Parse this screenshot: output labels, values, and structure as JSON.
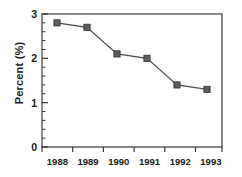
{
  "chart_data": {
    "type": "line",
    "title": "",
    "xlabel": "",
    "ylabel": "Percent (%)",
    "categories": [
      "1988",
      "1989",
      "1990",
      "1991",
      "1992",
      "1993"
    ],
    "values": [
      2.8,
      2.7,
      2.1,
      2.0,
      1.4,
      1.3
    ],
    "series": [
      {
        "name": "Percent",
        "values": [
          2.8,
          2.7,
          2.1,
          2.0,
          1.4,
          1.3
        ],
        "marker": "square",
        "marker_color": "#5c5c5c",
        "line_color": "#4a4a4a"
      }
    ],
    "ylim": [
      0,
      3
    ],
    "yticks": [
      0,
      1,
      2,
      3
    ],
    "ytick_labels": [
      "0",
      "1",
      "2",
      "3"
    ],
    "y_minor_ticks_per_interval": 4,
    "xtick_labels": [
      "1988",
      "1989",
      "1990",
      "1991",
      "1992",
      "1993"
    ],
    "grid": false,
    "legend": false,
    "frame": "box",
    "background_color": "#ffffff",
    "axis_color": "#3a3a3a"
  },
  "axes": {
    "y_title": "Percent (%)",
    "y_labels": [
      "3",
      "2",
      "1",
      "0"
    ],
    "x_labels": [
      "1988",
      "1989",
      "1990",
      "1991",
      "1992",
      "1993"
    ]
  }
}
